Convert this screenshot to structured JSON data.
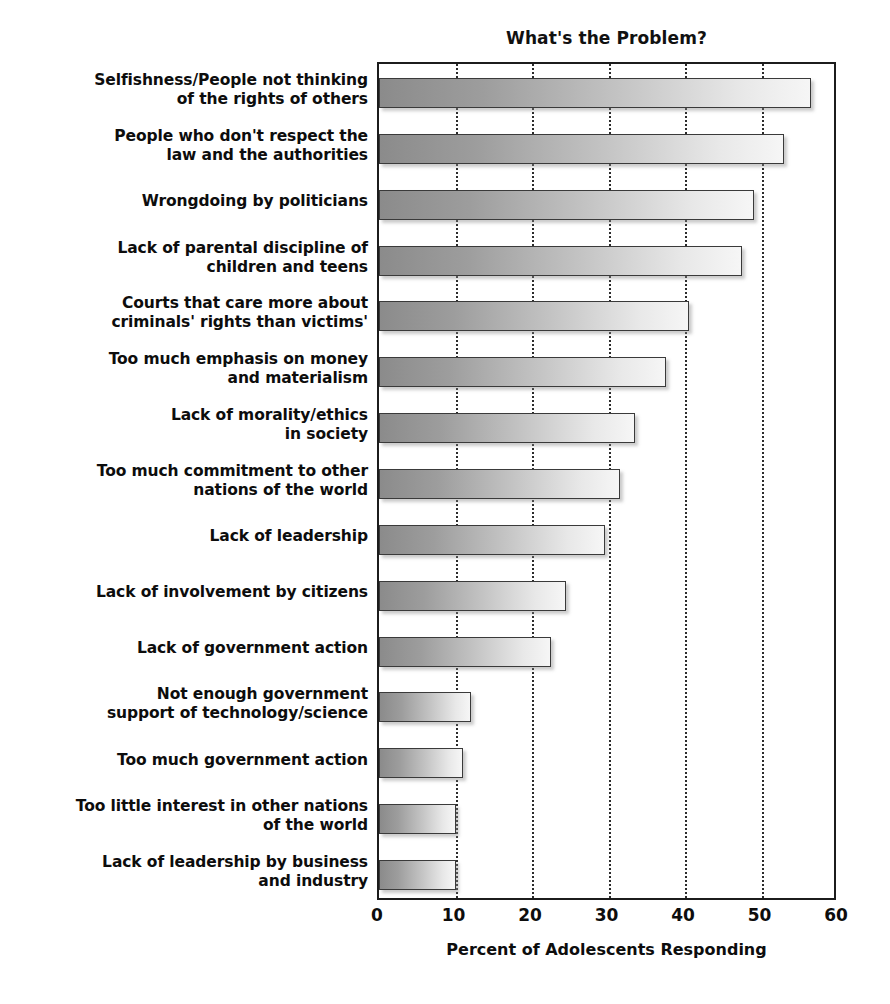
{
  "chart_data": {
    "type": "bar",
    "orientation": "horizontal",
    "title": "What's the Problem?",
    "xlabel": "Percent of Adolescents Responding",
    "ylabel": "",
    "xlim": [
      0,
      60
    ],
    "xticks": [
      0,
      10,
      20,
      30,
      40,
      50,
      60
    ],
    "xtick_labels": [
      "0",
      "10",
      "20",
      "30",
      "40",
      "50",
      "60"
    ],
    "grid": true,
    "grid_axis": "x",
    "grid_style": "dotted",
    "legend": false,
    "categories": [
      "Selfishness/People not thinking of the rights of others",
      "People who don't respect the law and the authorities",
      "Wrongdoing by politicians",
      "Lack of parental discipline of children and teens",
      "Courts that care more about criminals' rights than victims'",
      "Too much emphasis on money and materialism",
      "Lack of morality/ethics in society",
      "Too much commitment to other nations of the world",
      "Lack of leadership",
      "Lack of involvement by citizens",
      "Lack of government action",
      "Not enough government support of technology/science",
      "Too much government action",
      "Too little interest in other nations of the world",
      "Lack of leadership by business and industry"
    ],
    "category_lines": [
      [
        "Selfishness/People not thinking",
        "of the rights of others"
      ],
      [
        "People who don't respect the",
        "law and the authorities"
      ],
      [
        "Wrongdoing by politicians"
      ],
      [
        "Lack of parental discipline of",
        "children and teens"
      ],
      [
        "Courts that care more about",
        "criminals' rights than victims'"
      ],
      [
        "Too much emphasis on money",
        "and materialism"
      ],
      [
        "Lack of morality/ethics",
        "in society"
      ],
      [
        "Too much commitment to other",
        "nations of the world"
      ],
      [
        "Lack of leadership"
      ],
      [
        "Lack of involvement by citizens"
      ],
      [
        "Lack of government action"
      ],
      [
        "Not enough government",
        "support of technology/science"
      ],
      [
        "Too much government action"
      ],
      [
        "Too little interest in other nations",
        "of the world"
      ],
      [
        "Lack of leadership by business",
        "and industry"
      ]
    ],
    "values": [
      56.5,
      53,
      49,
      47.5,
      40.5,
      37.5,
      33.5,
      31.5,
      29.5,
      24.5,
      22.5,
      12,
      11,
      10,
      10
    ],
    "bar_gradient_start": "#8b8b8b",
    "bar_gradient_end": "#f6f6f6",
    "bar_edge_color": "#3a3a3a",
    "axis_color": "#1c1c1c",
    "text_color": "#0d0d0d",
    "background": "#ffffff"
  }
}
